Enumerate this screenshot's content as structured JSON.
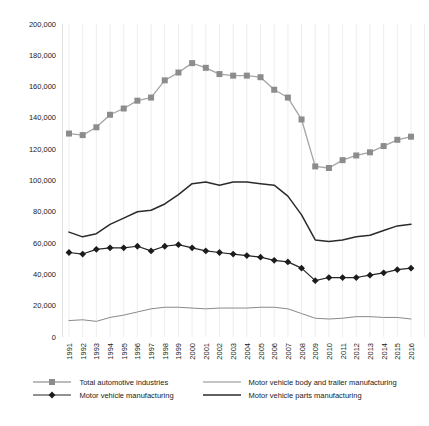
{
  "chart_data": {
    "type": "line",
    "title": "",
    "xlabel": "",
    "ylabel": "",
    "x": [
      "1991",
      "1992",
      "1993",
      "1994",
      "1995",
      "1996",
      "1997",
      "1998",
      "1999",
      "2000",
      "2001",
      "2002",
      "2003",
      "2004",
      "2005",
      "2006",
      "2007",
      "2008",
      "2009",
      "2010",
      "2011",
      "2012",
      "2013",
      "2014",
      "2015",
      "2016"
    ],
    "ylim": [
      0,
      200000
    ],
    "ytick_step": 20000,
    "ytick_labels": [
      "0",
      "20,000",
      "40,000",
      "60,000",
      "80,000",
      "100,000",
      "120,000",
      "140,000",
      "160,000",
      "180,000",
      "200,000"
    ],
    "grid": "vertical",
    "legend_position": "bottom",
    "series": [
      {
        "name": "Total automotive industries",
        "marker": "square",
        "color": "#a4a4a4",
        "marker_color": "#8c8c8c",
        "width": 1.3,
        "values": [
          130000,
          129000,
          134000,
          142000,
          146000,
          151000,
          153000,
          164000,
          169000,
          175000,
          172000,
          168000,
          167000,
          167000,
          166000,
          158000,
          153000,
          139000,
          109000,
          108000,
          113000,
          116000,
          118000,
          122000,
          126000,
          128000
        ]
      },
      {
        "name": "Motor vehicle manufacturing",
        "marker": "diamond",
        "color": "#262626",
        "marker_color": "#1c1c1c",
        "width": 1.2,
        "values": [
          54000,
          53000,
          56000,
          57000,
          57000,
          58000,
          55000,
          58000,
          59000,
          57000,
          55000,
          54000,
          53000,
          52000,
          51000,
          49000,
          48000,
          44000,
          36000,
          38000,
          38000,
          38000,
          39500,
          41000,
          43000,
          44000
        ]
      },
      {
        "name": "Motor vehicle body and trailer manufacturing",
        "marker": "none",
        "color": "#8a8a8a",
        "marker_color": "#8a8a8a",
        "width": 1,
        "values": [
          10500,
          11000,
          10000,
          12500,
          14000,
          16000,
          18000,
          19000,
          19000,
          18500,
          18000,
          18500,
          18500,
          18500,
          19000,
          19000,
          18000,
          15000,
          12000,
          11500,
          12000,
          13000,
          13000,
          12500,
          12500,
          11500
        ]
      },
      {
        "name": "Motor vehicle parts manufacturing",
        "marker": "none",
        "color": "#2b2b2b",
        "marker_color": "#2b2b2b",
        "width": 1.5,
        "values": [
          67000,
          64000,
          66000,
          72000,
          76000,
          80000,
          81000,
          85000,
          91000,
          98000,
          99000,
          97000,
          99000,
          99000,
          98000,
          97000,
          90000,
          78000,
          62000,
          61000,
          62000,
          64000,
          65000,
          68000,
          71000,
          72000
        ]
      }
    ],
    "legend_order": [
      0,
      2,
      1,
      3
    ]
  },
  "colors": {
    "background": "#ffffff",
    "gridline": "#ededed",
    "axis_line": "#e0e0e0",
    "text": "#1a1a1a"
  }
}
